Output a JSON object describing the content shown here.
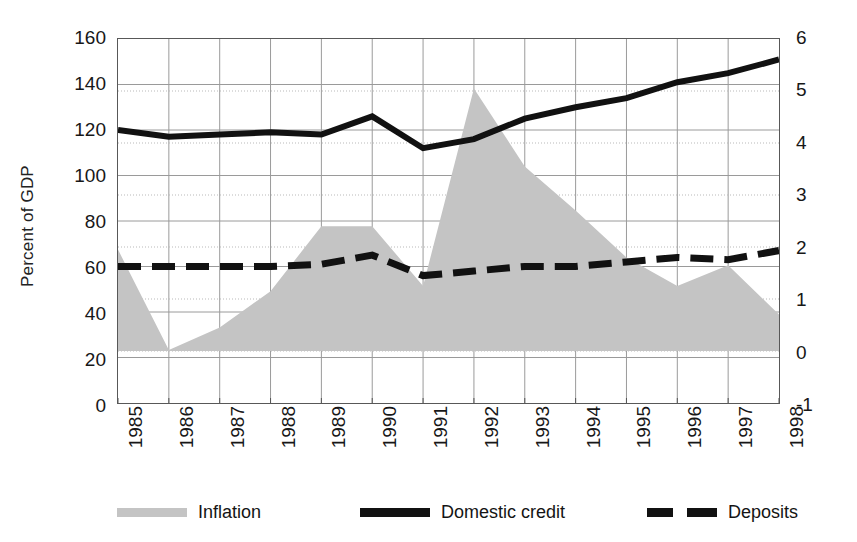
{
  "axes": {
    "left_title": "Percent of GDP",
    "left_ticks": [
      "160",
      "140",
      "120",
      "100",
      "80",
      "60",
      "40",
      "20",
      "0"
    ],
    "right_ticks": [
      "6",
      "5",
      "4",
      "3",
      "2",
      "1",
      "0",
      "-1"
    ],
    "left_range": [
      0,
      160
    ],
    "right_range": [
      -1,
      6
    ]
  },
  "legend": {
    "items": [
      {
        "label": "Inflation",
        "swatch": "area-swatch",
        "color": "#c4c4c4"
      },
      {
        "label": "Domestic credit",
        "swatch": "solid-line-swatch",
        "color": "#111111"
      },
      {
        "label": "Deposits",
        "swatch": "dashed-line-swatch",
        "color": "#111111"
      }
    ]
  },
  "chart_data": {
    "type": "area",
    "title": "",
    "xlabel": "",
    "ylabel": "Percent of GDP",
    "y2label": "",
    "grid": true,
    "legend_position": "bottom",
    "categories": [
      "1985",
      "1986",
      "1987",
      "1988",
      "1989",
      "1990",
      "1991",
      "1992",
      "1993",
      "1994",
      "1995",
      "1996",
      "1997",
      "1998"
    ],
    "ylim": [
      0,
      160
    ],
    "y2lim": [
      -1,
      6
    ],
    "series": [
      {
        "name": "Inflation",
        "type": "area",
        "axis": "right",
        "color": "#c4c4c4",
        "values": [
          1.95,
          0.02,
          0.45,
          1.15,
          2.4,
          2.4,
          1.25,
          5.05,
          3.55,
          2.7,
          1.8,
          1.25,
          1.65,
          0.7
        ]
      },
      {
        "name": "Domestic credit",
        "type": "line",
        "axis": "left",
        "color": "#111111",
        "values": [
          120,
          117,
          118,
          119,
          118,
          126,
          112,
          116,
          125,
          130,
          134,
          141,
          145,
          151
        ]
      },
      {
        "name": "Deposits",
        "type": "line-dashed",
        "axis": "left",
        "color": "#111111",
        "values": [
          60,
          60,
          60,
          60,
          61,
          65,
          56,
          58,
          60,
          60,
          62,
          64,
          63,
          67
        ]
      }
    ]
  }
}
